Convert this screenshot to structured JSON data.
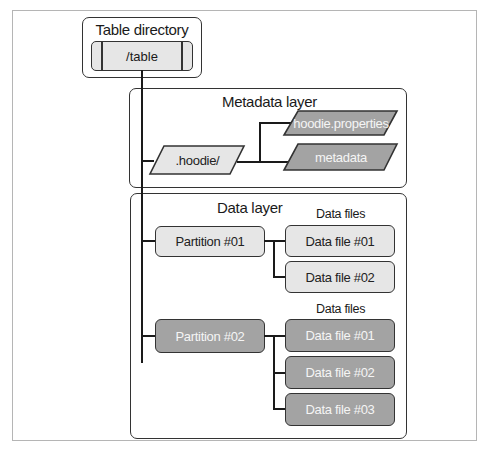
{
  "table_directory": {
    "title": "Table directory",
    "path": "/table"
  },
  "metadata_layer": {
    "title": "Metadata layer",
    "folder": ".hoodie/",
    "files": [
      {
        "label": "hoodie.properties"
      },
      {
        "label": "metadata"
      }
    ]
  },
  "data_layer": {
    "title": "Data layer",
    "partitions": [
      {
        "label": "Partition #01",
        "files_title": "Data files",
        "files": [
          {
            "label": "Data file #01"
          },
          {
            "label": "Data file #02"
          }
        ]
      },
      {
        "label": "Partition #02",
        "files_title": "Data files",
        "files": [
          {
            "label": "Data file #01"
          },
          {
            "label": "Data file #02"
          },
          {
            "label": "Data file #03"
          }
        ]
      }
    ]
  },
  "colors": {
    "light_fill": "#e6e6e6",
    "dark_fill": "#a3a3a3",
    "stroke": "#333333"
  }
}
